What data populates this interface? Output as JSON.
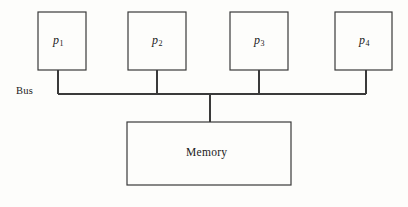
{
  "figure": {
    "type": "diagram",
    "background_color": "#fdfdfb",
    "stroke_color": "#3a3a3a",
    "text_color": "#1a1a1a"
  },
  "processors": [
    {
      "id": "p1",
      "label": "p",
      "subscript": "1",
      "box": {
        "x": 38,
        "y": 12,
        "w": 48,
        "h": 58
      },
      "connector_x": 58
    },
    {
      "id": "p2",
      "label": "p",
      "subscript": "2",
      "box": {
        "x": 128,
        "y": 12,
        "w": 58,
        "h": 58
      },
      "connector_x": 157
    },
    {
      "id": "p3",
      "label": "p",
      "subscript": "3",
      "box": {
        "x": 230,
        "y": 12,
        "w": 58,
        "h": 58
      },
      "connector_x": 259
    },
    {
      "id": "p4",
      "label": "p",
      "subscript": "4",
      "box": {
        "x": 335,
        "y": 12,
        "w": 57,
        "h": 58
      },
      "connector_x": 366
    }
  ],
  "bus": {
    "label": "Bus",
    "label_x": 16,
    "label_y": 85,
    "line_y": 94,
    "line_x_start": 58,
    "line_x_end": 366
  },
  "memory": {
    "label": "Memory",
    "box": {
      "x": 127,
      "y": 122,
      "w": 164,
      "h": 63
    },
    "connector_x": 210,
    "connector_y_top": 94,
    "connector_y_bottom": 122
  }
}
